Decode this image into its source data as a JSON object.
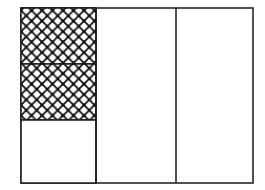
{
  "diagram": {
    "type": "fraction-area-model",
    "columns": 3,
    "first_column_rows": 3,
    "shaded_cells": 2,
    "pattern": "crosshatch",
    "colors": {
      "stroke": "#1a1a1a",
      "fill": "#ffffff",
      "hatch": "#111111"
    }
  }
}
